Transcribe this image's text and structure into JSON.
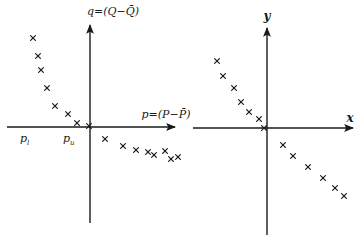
{
  "left_panel": {
    "y_axis_label": "q=(Q−Q̄)",
    "x_axis_label": "p=(P−P̄)",
    "tick_labels": [
      {
        "text": "p",
        "sub": "l"
      },
      {
        "text": "p",
        "sub": "u"
      }
    ],
    "axis": {
      "origin": [
        90,
        127
      ],
      "x_start": 7,
      "x_end": 175,
      "y_top": 25,
      "y_bottom": 223
    },
    "points": [
      [
        33,
        38
      ],
      [
        38,
        56
      ],
      [
        41,
        70
      ],
      [
        47,
        88
      ],
      [
        55,
        106
      ],
      [
        68,
        114
      ],
      [
        77,
        123
      ],
      [
        89,
        126
      ],
      [
        105,
        139
      ],
      [
        123,
        146
      ],
      [
        136,
        150
      ],
      [
        148,
        152
      ],
      [
        154,
        155
      ],
      [
        165,
        151
      ],
      [
        171,
        159
      ],
      [
        178,
        157
      ]
    ]
  },
  "right_panel": {
    "y_axis_label": "y",
    "x_axis_label": "x",
    "axis": {
      "origin": [
        267,
        128
      ],
      "x_start": 193,
      "x_end": 353,
      "y_top": 28,
      "y_bottom": 235
    },
    "points": [
      [
        217,
        61
      ],
      [
        223,
        76
      ],
      [
        234,
        88
      ],
      [
        241,
        102
      ],
      [
        249,
        112
      ],
      [
        259,
        119
      ],
      [
        264,
        128
      ],
      [
        283,
        145
      ],
      [
        293,
        156
      ],
      [
        308,
        167
      ],
      [
        323,
        178
      ],
      [
        335,
        188
      ],
      [
        344,
        196
      ]
    ]
  },
  "colors": {
    "ink": "#1a1a1a",
    "paper": "#ffffff"
  }
}
